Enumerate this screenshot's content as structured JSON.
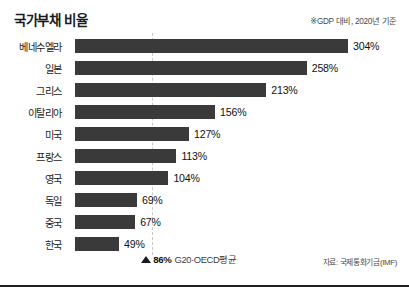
{
  "header": {
    "title": "국가부채 비율",
    "note": "※GDP 대비, 2020년 기준"
  },
  "average": {
    "marker_icon": "triangle-up-icon",
    "value": "86%",
    "label": "G20·OECD평균",
    "value_number": 86
  },
  "footer": {
    "source": "자료: 국제통화기금(IMF)"
  },
  "chart_data": {
    "type": "bar",
    "orientation": "horizontal",
    "title": "국가부채 비율",
    "subtitle": "※GDP 대비, 2020년 기준",
    "xlabel": "",
    "ylabel": "",
    "unit": "%",
    "xlim": [
      0,
      304
    ],
    "grid": false,
    "legend": "none",
    "categories": [
      "베네수엘라",
      "일본",
      "그리스",
      "이탈리아",
      "미국",
      "프랑스",
      "영국",
      "독일",
      "중국",
      "한국"
    ],
    "values": [
      304,
      258,
      213,
      156,
      127,
      113,
      104,
      69,
      67,
      49
    ],
    "value_labels": [
      "304%",
      "258%",
      "213%",
      "156%",
      "127%",
      "113%",
      "104%",
      "69%",
      "67%",
      "49%"
    ],
    "bar_color": "#3a3a3a",
    "reference_line": {
      "value": 86,
      "label": "G20·OECD평균",
      "value_label": "86%",
      "style": "dashed",
      "color": "#c9c9c9"
    },
    "source": "자료: 국제통화기금(IMF)"
  },
  "colors": {
    "bar": "#3a3a3a",
    "text": "#1a1a1a",
    "reference_line": "#c9c9c9",
    "rule": "#1f1f1f",
    "background": "#ffffff"
  }
}
